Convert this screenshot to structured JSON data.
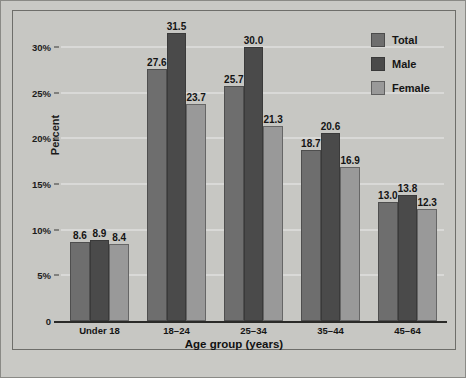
{
  "chart_data": {
    "type": "bar",
    "title": "",
    "xlabel": "Age group (years)",
    "ylabel": "Percent",
    "categories": [
      "Under 18",
      "18–24",
      "25–34",
      "35–44",
      "45–64"
    ],
    "series": [
      {
        "name": "Total",
        "color": "#6e6e6e",
        "values": [
          8.6,
          27.6,
          25.7,
          18.7,
          13.0
        ]
      },
      {
        "name": "Male",
        "color": "#4a4a4a",
        "values": [
          8.9,
          31.5,
          30.0,
          20.6,
          13.8
        ]
      },
      {
        "name": "Female",
        "color": "#999999",
        "values": [
          8.4,
          23.7,
          21.3,
          16.9,
          12.3
        ]
      }
    ],
    "ylim": [
      0,
      32.5
    ],
    "yticks": [
      0,
      5,
      10,
      15,
      20,
      25,
      30
    ],
    "ytick_labels": [
      "0",
      "5%",
      "10%",
      "15%",
      "20%",
      "25%",
      "30%"
    ],
    "grid": true,
    "legend_position": "top-right",
    "value_labels": true,
    "background_color": "#c7c7c3",
    "gridline_color": "#ececeb"
  },
  "legend": {
    "items": [
      {
        "label": "Total"
      },
      {
        "label": "Male"
      },
      {
        "label": "Female"
      }
    ]
  },
  "axes": {
    "y_title": "Percent",
    "x_title": "Age group (years)"
  }
}
